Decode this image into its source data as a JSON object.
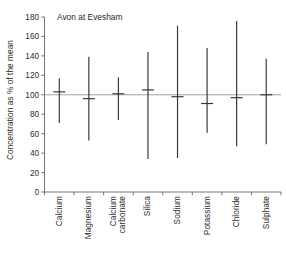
{
  "chart_data": {
    "type": "bar",
    "title": "Avon at Evesham",
    "xlabel": "",
    "ylabel": "Concentration as % of the mean",
    "ylim": [
      0,
      180
    ],
    "ytick_step": 20,
    "yticks": [
      0,
      20,
      40,
      60,
      80,
      100,
      120,
      140,
      160,
      180
    ],
    "ytick_labels": [
      "0",
      "20",
      "40",
      "60",
      "80",
      "100",
      "120",
      "140",
      "160",
      "180"
    ],
    "grid": false,
    "legend_position": "none",
    "reference_line": 100,
    "categories": [
      "Calcium",
      "Magnesium",
      "Calcium carbonate",
      "Silica",
      "Sodium",
      "Potassium",
      "Chloride",
      "Sulphate"
    ],
    "category_label_lines": [
      [
        "Calcium"
      ],
      [
        "Magnesium"
      ],
      [
        "Calcium",
        "carbonate"
      ],
      [
        "Silica"
      ],
      [
        "Sodium"
      ],
      [
        "Potassium"
      ],
      [
        "Chloride"
      ],
      [
        "Sulphate"
      ]
    ],
    "series": [
      {
        "name": "minimum",
        "values": [
          71,
          53,
          74,
          34,
          35,
          61,
          47,
          49
        ]
      },
      {
        "name": "mean",
        "values": [
          103,
          96,
          101,
          105,
          98,
          91,
          97,
          100
        ]
      },
      {
        "name": "maximum",
        "values": [
          117,
          139,
          118,
          144,
          171,
          148,
          176,
          137
        ]
      }
    ],
    "points": [
      {
        "category": "Calcium",
        "min": 71,
        "mean": 103,
        "max": 117
      },
      {
        "category": "Magnesium",
        "min": 53,
        "mean": 96,
        "max": 139
      },
      {
        "category": "Calcium carbonate",
        "min": 74,
        "mean": 101,
        "max": 118
      },
      {
        "category": "Silica",
        "min": 34,
        "mean": 105,
        "max": 144
      },
      {
        "category": "Sodium",
        "min": 35,
        "mean": 98,
        "max": 171
      },
      {
        "category": "Potassium",
        "min": 61,
        "mean": 91,
        "max": 148
      },
      {
        "category": "Chloride",
        "min": 47,
        "mean": 97,
        "max": 176
      },
      {
        "category": "Sulphate",
        "min": 49,
        "mean": 100,
        "max": 137
      }
    ],
    "colors": {
      "line": "#333333",
      "axis": "#666666",
      "reference": "#999999",
      "background": "#ffffff",
      "text": "#2a2a2a"
    }
  }
}
